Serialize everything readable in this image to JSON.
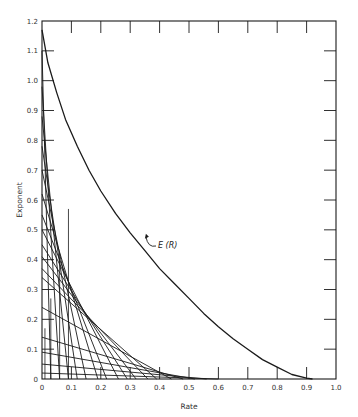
{
  "chart_data": {
    "type": "line",
    "title": "",
    "xlabel": "Rate",
    "ylabel": "Exponent",
    "xlim": [
      0,
      1.0
    ],
    "ylim": [
      0,
      1.2
    ],
    "grid": false,
    "x_ticks": [
      "0",
      "0.1",
      "0.2",
      "0.3",
      "0.4",
      "0.5",
      "0.6",
      "0.7",
      "0.8",
      "0.9",
      "1.0"
    ],
    "y_ticks": [
      "0",
      "0.1",
      "0.2",
      "0.3",
      "0.4",
      "0.5",
      "0.6",
      "0.7",
      "0.8",
      "0.9",
      "1.0",
      "1.1",
      "1.2"
    ],
    "series": [
      {
        "name": "E(R)",
        "x": [
          0.0,
          0.02,
          0.05,
          0.08,
          0.12,
          0.16,
          0.2,
          0.25,
          0.3,
          0.35,
          0.4,
          0.45,
          0.5,
          0.55,
          0.6,
          0.65,
          0.7,
          0.75,
          0.8,
          0.85,
          0.9,
          0.92
        ],
        "y": [
          1.17,
          1.06,
          0.96,
          0.87,
          0.78,
          0.7,
          0.63,
          0.555,
          0.49,
          0.43,
          0.37,
          0.32,
          0.27,
          0.22,
          0.175,
          0.135,
          0.1,
          0.065,
          0.04,
          0.015,
          0.003,
          0.0
        ]
      }
    ],
    "tangent_lines": [
      {
        "y_intercept": 0.02,
        "x_intercept": 0.6
      },
      {
        "y_intercept": 0.05,
        "x_intercept": 0.56
      },
      {
        "y_intercept": 0.09,
        "x_intercept": 0.52
      },
      {
        "y_intercept": 0.14,
        "x_intercept": 0.48
      },
      {
        "y_intercept": 0.24,
        "x_intercept": 0.44
      },
      {
        "y_intercept": 0.34,
        "x_intercept": 0.39
      },
      {
        "y_intercept": 0.37,
        "x_intercept": 0.36
      },
      {
        "y_intercept": 0.41,
        "x_intercept": 0.32
      },
      {
        "y_intercept": 0.45,
        "x_intercept": 0.29
      },
      {
        "y_intercept": 0.5,
        "x_intercept": 0.26
      },
      {
        "y_intercept": 0.55,
        "x_intercept": 0.22
      },
      {
        "y_intercept": 0.62,
        "x_intercept": 0.19
      },
      {
        "y_intercept": 0.7,
        "x_intercept": 0.15
      },
      {
        "y_intercept": 0.78,
        "x_intercept": 0.12
      },
      {
        "y_intercept": 0.88,
        "x_intercept": 0.09
      },
      {
        "y_intercept": 0.98,
        "x_intercept": 0.06
      },
      {
        "y_intercept": 1.1,
        "x_intercept": 0.03
      }
    ],
    "annotations": [
      {
        "text": "E (R)",
        "x": 0.39,
        "y": 0.45,
        "arrow_to": [
          0.35,
          0.47
        ]
      }
    ]
  },
  "labels": {
    "xlabel": "Rate",
    "ylabel": "Exponent",
    "annotation": "E (R)",
    "caption": "Figure 14 - Graphical construction of E (R) from tangent lines"
  }
}
